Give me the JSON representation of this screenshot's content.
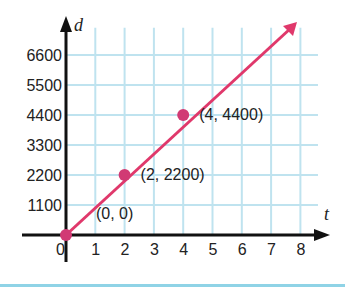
{
  "chart_data": {
    "type": "line",
    "title": "",
    "xlabel": "t",
    "ylabel": "d",
    "x_ticks": [
      0,
      1,
      2,
      3,
      4,
      5,
      6,
      7,
      8
    ],
    "y_ticks": [
      1100,
      2200,
      3300,
      4400,
      5500,
      6600
    ],
    "x_tick_labels": [
      "0",
      "1",
      "2",
      "3",
      "4",
      "5",
      "6",
      "7",
      "8"
    ],
    "y_tick_labels": [
      "1100",
      "2200",
      "3300",
      "4400",
      "5500",
      "6600"
    ],
    "xlim": [
      0,
      8.5
    ],
    "ylim": [
      0,
      7000
    ],
    "grid": true,
    "series": [
      {
        "name": "d = 1100t",
        "x": [
          0,
          7.8
        ],
        "y": [
          0,
          8580
        ],
        "color": "#e0386b",
        "arrow_end": true
      }
    ],
    "points": [
      {
        "x": 0,
        "y": 0,
        "label": "(0, 0)"
      },
      {
        "x": 2,
        "y": 2200,
        "label": "(2, 2200)"
      },
      {
        "x": 4,
        "y": 4400,
        "label": "(4, 4400)"
      }
    ],
    "colors": {
      "line": "#e0386b",
      "point": "#d13a74",
      "grid": "#bfe3ef",
      "axis": "#111111",
      "bottom_rule": "#8fd3e6"
    }
  }
}
